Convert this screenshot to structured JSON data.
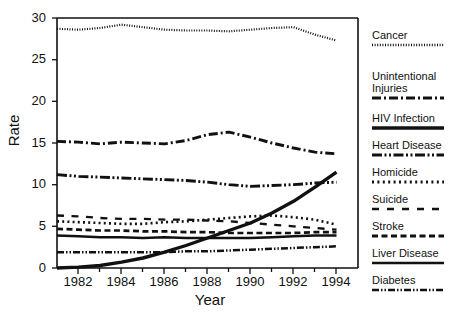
{
  "chart_data": {
    "type": "line",
    "title": "",
    "xlabel": "Year",
    "ylabel": "Rate",
    "xlim": [
      1981,
      1995
    ],
    "ylim": [
      0,
      30
    ],
    "xticks": [
      "1982",
      "1984",
      "1986",
      "1988",
      "1990",
      "1992",
      "1994"
    ],
    "yticks": [
      "0",
      "5",
      "10",
      "15",
      "20",
      "25",
      "30"
    ],
    "grid": false,
    "legend_position": "right",
    "x": [
      1981,
      1982,
      1983,
      1984,
      1985,
      1986,
      1987,
      1988,
      1989,
      1990,
      1991,
      1992,
      1993,
      1994
    ],
    "series": [
      {
        "name": "Cancer",
        "style": "dotted-fine",
        "values": [
          28.7,
          28.6,
          28.8,
          29.2,
          28.9,
          28.6,
          28.5,
          28.5,
          28.4,
          28.6,
          28.8,
          28.9,
          28.0,
          27.3
        ]
      },
      {
        "name": "Unintentional Injuries",
        "style": "dash-dot",
        "values": [
          15.2,
          15.1,
          14.9,
          15.1,
          15.0,
          14.9,
          15.3,
          16.0,
          16.3,
          15.7,
          15.0,
          14.4,
          13.9,
          13.7
        ]
      },
      {
        "name": "HIV Infection",
        "style": "solid-thick",
        "values": [
          0.0,
          0.1,
          0.3,
          0.7,
          1.2,
          1.9,
          2.7,
          3.6,
          4.5,
          5.4,
          6.6,
          8.0,
          9.7,
          11.5
        ]
      },
      {
        "name": "Heart Disease",
        "style": "dash-dot-dot",
        "values": [
          11.2,
          11.0,
          10.9,
          10.8,
          10.7,
          10.6,
          10.5,
          10.3,
          10.0,
          9.8,
          9.9,
          10.0,
          10.2,
          10.3
        ]
      },
      {
        "name": "Homicide",
        "style": "dotted-medium",
        "values": [
          5.6,
          5.5,
          5.4,
          5.3,
          5.3,
          5.5,
          5.6,
          5.8,
          6.0,
          6.2,
          6.3,
          6.1,
          5.8,
          5.2
        ]
      },
      {
        "name": "Suicide",
        "style": "dash-long",
        "values": [
          6.3,
          6.2,
          6.0,
          5.9,
          5.9,
          5.8,
          5.8,
          5.7,
          5.6,
          5.4,
          5.2,
          5.0,
          4.8,
          4.6
        ]
      },
      {
        "name": "Stroke",
        "style": "dash-medium",
        "values": [
          4.7,
          4.6,
          4.5,
          4.5,
          4.4,
          4.4,
          4.3,
          4.3,
          4.2,
          4.2,
          4.2,
          4.2,
          4.3,
          4.3
        ]
      },
      {
        "name": "Liver Disease",
        "style": "solid-thin",
        "values": [
          3.9,
          3.8,
          3.7,
          3.7,
          3.6,
          3.7,
          3.6,
          3.6,
          3.6,
          3.6,
          3.7,
          3.8,
          3.9,
          3.9
        ]
      },
      {
        "name": "Diabetes",
        "style": "dash-dot-dot-thin",
        "values": [
          1.9,
          1.9,
          1.9,
          1.9,
          1.9,
          1.9,
          2.0,
          2.0,
          2.1,
          2.2,
          2.3,
          2.4,
          2.5,
          2.6
        ]
      }
    ]
  },
  "legend": {
    "items": [
      {
        "label_line1": "Cancer",
        "label_line2": ""
      },
      {
        "label_line1": "Unintentional",
        "label_line2": "Injuries"
      },
      {
        "label_line1": "HIV Infection",
        "label_line2": ""
      },
      {
        "label_line1": "Heart Disease",
        "label_line2": ""
      },
      {
        "label_line1": "Homicide",
        "label_line2": ""
      },
      {
        "label_line1": "Suicide",
        "label_line2": ""
      },
      {
        "label_line1": "Stroke",
        "label_line2": ""
      },
      {
        "label_line1": "Liver Disease",
        "label_line2": ""
      },
      {
        "label_line1": "Diabetes",
        "label_line2": ""
      }
    ]
  },
  "colors": {
    "ink": "#111111",
    "background": "#ffffff"
  }
}
